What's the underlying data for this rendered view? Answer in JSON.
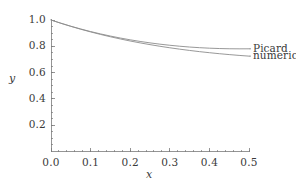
{
  "chart_data": {
    "type": "line",
    "title": "",
    "xlabel": "x",
    "ylabel": "y",
    "xlim": [
      0.0,
      0.5
    ],
    "ylim": [
      0.0,
      1.05
    ],
    "grid": false,
    "legend_position": "right-inline",
    "xticks": [
      "0.0",
      "0.1",
      "0.2",
      "0.3",
      "0.4",
      "0.5"
    ],
    "xtick_values": [
      0.0,
      0.1,
      0.2,
      0.3,
      0.4,
      0.5
    ],
    "yticks": [
      "0.2",
      "0.4",
      "0.6",
      "0.8",
      "1.0"
    ],
    "ytick_values": [
      0.2,
      0.4,
      0.6,
      0.8,
      1.0
    ],
    "x_minor_step": 0.02,
    "y_minor_step": 0.05,
    "x": [
      0.0,
      0.025,
      0.05,
      0.075,
      0.1,
      0.125,
      0.15,
      0.175,
      0.2,
      0.225,
      0.25,
      0.275,
      0.3,
      0.325,
      0.35,
      0.375,
      0.4,
      0.425,
      0.45,
      0.475,
      0.5
    ],
    "series": [
      {
        "name": "Picard",
        "color": "#8c8c8c",
        "values": [
          1.0,
          0.9755,
          0.9527,
          0.9317,
          0.9122,
          0.8943,
          0.8779,
          0.8629,
          0.8493,
          0.837,
          0.826,
          0.8163,
          0.8078,
          0.8005,
          0.7944,
          0.7895,
          0.7857,
          0.783,
          0.7814,
          0.7807,
          0.781
        ]
      },
      {
        "name": "numerical",
        "color": "#8c8c8c",
        "values": [
          1.0,
          0.9752,
          0.9518,
          0.9299,
          0.9094,
          0.8903,
          0.8724,
          0.8558,
          0.8403,
          0.8259,
          0.8126,
          0.8002,
          0.7888,
          0.7782,
          0.7685,
          0.7595,
          0.7513,
          0.7438,
          0.737,
          0.7308,
          0.7252
        ]
      }
    ]
  },
  "annotations": {
    "series_labels": [
      {
        "text": "Picard",
        "for": "Picard"
      },
      {
        "text": "numerical",
        "for": "numerical"
      }
    ]
  }
}
